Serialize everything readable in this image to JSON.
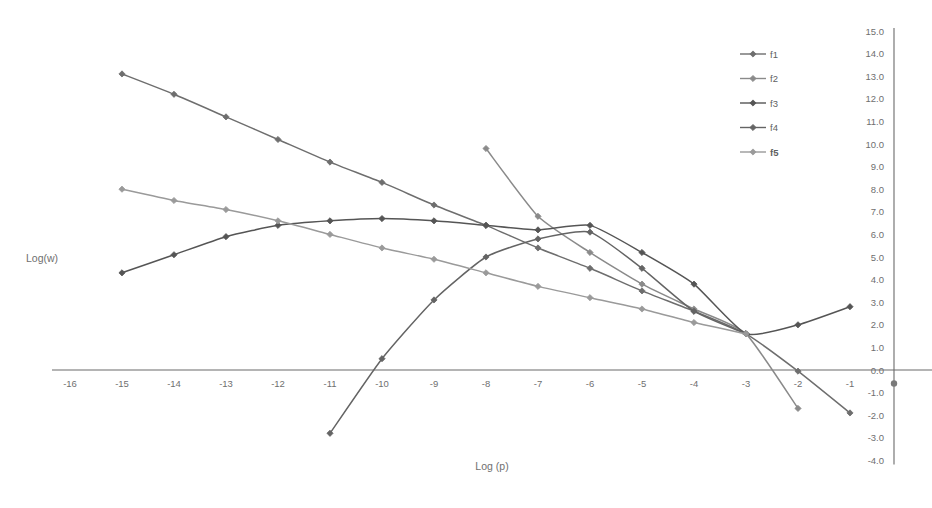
{
  "chart_data": {
    "type": "line",
    "title": "",
    "xlabel": "Log (p)",
    "ylabel": "Log(w)",
    "xlim": [
      -16.5,
      -0.6
    ],
    "ylim": [
      -4.0,
      15.0
    ],
    "grid": false,
    "y_axis_position": "right",
    "legend_position": "top-right",
    "xticks": [
      "-16",
      "-15",
      "-14",
      "-13",
      "-12",
      "-11",
      "-10",
      "-9",
      "-8",
      "-7",
      "-6",
      "-5",
      "-4",
      "-3",
      "-2",
      "-1"
    ],
    "xtick_values": [
      -16,
      -15,
      -14,
      -13,
      -12,
      -11,
      -10,
      -9,
      -8,
      -7,
      -6,
      -5,
      -4,
      -3,
      -2,
      -1
    ],
    "yticks": [
      "15.0",
      "14.0",
      "13.0",
      "12.0",
      "11.0",
      "10.0",
      "9.0",
      "8.0",
      "7.0",
      "6.0",
      "5.0",
      "4.0",
      "3.0",
      "2.0",
      "1.0",
      "0.0",
      "-1.0",
      "-2.0",
      "-3.0",
      "-4.0"
    ],
    "ytick_values": [
      15,
      14,
      13,
      12,
      11,
      10,
      9,
      8,
      7,
      6,
      5,
      4,
      3,
      2,
      1,
      0,
      -1,
      -2,
      -3,
      -4
    ],
    "series": [
      {
        "name": "f1",
        "color": "#6e6e6e",
        "marker": "diamond",
        "x": [
          -15,
          -14,
          -13,
          -12,
          -11,
          -10,
          -9,
          -8,
          -7,
          -6,
          -5,
          -4,
          -3,
          -2,
          -1
        ],
        "values": [
          13.1,
          12.2,
          11.2,
          10.2,
          9.2,
          8.3,
          7.3,
          6.4,
          5.4,
          4.5,
          3.5,
          2.6,
          1.6,
          -0.05,
          -1.9
        ]
      },
      {
        "name": "f2",
        "color": "#8a8a8a",
        "marker": "diamond",
        "x": [
          -8,
          -7,
          -6,
          -5,
          -4,
          -3,
          -2
        ],
        "values": [
          9.8,
          6.8,
          5.2,
          3.8,
          2.7,
          1.6,
          -1.7
        ]
      },
      {
        "name": "f3",
        "color": "#555555",
        "marker": "diamond",
        "x": [
          -15,
          -14,
          -13,
          -12,
          -11,
          -10,
          -9,
          -8,
          -7,
          -6,
          -5,
          -4,
          -3,
          -2,
          -1
        ],
        "values": [
          4.3,
          5.1,
          5.9,
          6.4,
          6.6,
          6.7,
          6.6,
          6.4,
          6.2,
          6.4,
          5.2,
          3.8,
          1.6,
          2.0,
          2.8
        ]
      },
      {
        "name": "f4",
        "color": "#646464",
        "marker": "diamond",
        "x": [
          -11,
          -10,
          -9,
          -8,
          -7,
          -6,
          -5,
          -4,
          -3
        ],
        "values": [
          -2.8,
          0.5,
          3.1,
          5.0,
          5.8,
          6.1,
          4.5,
          2.6,
          1.6
        ]
      },
      {
        "name": "f5",
        "color": "#9a9a9a",
        "marker": "diamond",
        "x": [
          -15,
          -14,
          -13,
          -12,
          -11,
          -10,
          -9,
          -8,
          -7,
          -6,
          -5,
          -4,
          -3
        ],
        "values": [
          8.0,
          7.5,
          7.1,
          6.6,
          6.0,
          5.4,
          4.9,
          4.3,
          3.7,
          3.2,
          2.7,
          2.1,
          1.6
        ]
      }
    ]
  },
  "legend": {
    "items": [
      {
        "label": "f1",
        "color": "#6e6e6e",
        "bold": false
      },
      {
        "label": "f2",
        "color": "#8a8a8a",
        "bold": false
      },
      {
        "label": "f3",
        "color": "#555555",
        "bold": false
      },
      {
        "label": "f4",
        "color": "#646464",
        "bold": false
      },
      {
        "label": "f5",
        "color": "#9a9a9a",
        "bold": true
      }
    ]
  },
  "axis_titles": {
    "x": "Log (p)",
    "y": "Log(w)"
  },
  "colors": {
    "axis_line": "#6b6b6b",
    "tick_text": "#6f6f6f",
    "background": "#ffffff"
  }
}
